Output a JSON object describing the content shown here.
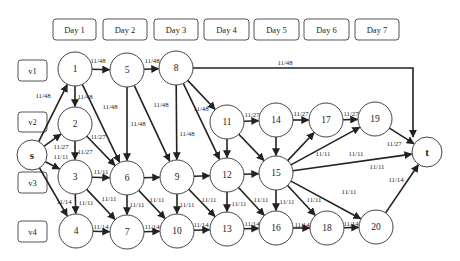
{
  "diagram": {
    "days": [
      "Day 1",
      "Day 2",
      "Day 3",
      "Day 4",
      "Day 5",
      "Day 6",
      "Day 7"
    ],
    "vehicles": [
      "v1",
      "v2",
      "v3",
      "v4"
    ],
    "nodes": [
      {
        "id": "s",
        "label": "s"
      },
      {
        "id": "1",
        "label": "1"
      },
      {
        "id": "2",
        "label": "2"
      },
      {
        "id": "3",
        "label": "3"
      },
      {
        "id": "4",
        "label": "4"
      },
      {
        "id": "5",
        "label": "5"
      },
      {
        "id": "6",
        "label": "6"
      },
      {
        "id": "7",
        "label": "7"
      },
      {
        "id": "8",
        "label": "8"
      },
      {
        "id": "9",
        "label": "9"
      },
      {
        "id": "10",
        "label": "10"
      },
      {
        "id": "11",
        "label": "11"
      },
      {
        "id": "12",
        "label": "12"
      },
      {
        "id": "13",
        "label": "13"
      },
      {
        "id": "14",
        "label": "14"
      },
      {
        "id": "15",
        "label": "15"
      },
      {
        "id": "16",
        "label": "16"
      },
      {
        "id": "17",
        "label": "17"
      },
      {
        "id": "18",
        "label": "18"
      },
      {
        "id": "19",
        "label": "19"
      },
      {
        "id": "20",
        "label": "20"
      },
      {
        "id": "t",
        "label": "t"
      }
    ],
    "edges": [
      {
        "from": "s",
        "to": "1",
        "label": "11/48"
      },
      {
        "from": "s",
        "to": "2",
        "label": "11/27"
      },
      {
        "from": "s",
        "to": "3",
        "label": "11/11"
      },
      {
        "from": "s",
        "to": "4",
        "label": "11/14"
      },
      {
        "from": "1",
        "to": "2",
        "label": "11/48"
      },
      {
        "from": "1",
        "to": "5",
        "label": "11/48"
      },
      {
        "from": "1",
        "to": "6",
        "label": "11/48"
      },
      {
        "from": "2",
        "to": "3",
        "label": "11/27"
      },
      {
        "from": "2",
        "to": "6",
        "label": "11/27"
      },
      {
        "from": "3",
        "to": "4",
        "label": "11/11"
      },
      {
        "from": "3",
        "to": "6",
        "label": "11/11"
      },
      {
        "from": "3",
        "to": "7",
        "label": "11/11"
      },
      {
        "from": "4",
        "to": "7",
        "label": "11/14"
      },
      {
        "from": "5",
        "to": "8",
        "label": "11/48"
      },
      {
        "from": "5",
        "to": "6",
        "label": "11/48"
      },
      {
        "from": "5",
        "to": "9",
        "label": "11/48"
      },
      {
        "from": "6",
        "to": "9",
        "label": ""
      },
      {
        "from": "6",
        "to": "7",
        "label": "11/11"
      },
      {
        "from": "6",
        "to": "10",
        "label": "11/11"
      },
      {
        "from": "7",
        "to": "10",
        "label": "11/14"
      },
      {
        "from": "8",
        "to": "t",
        "label": "11/48"
      },
      {
        "from": "8",
        "to": "9",
        "label": "11/48"
      },
      {
        "from": "8",
        "to": "11",
        "label": "11/48"
      },
      {
        "from": "8",
        "to": "12",
        "label": ""
      },
      {
        "from": "9",
        "to": "10",
        "label": "11/11"
      },
      {
        "from": "9",
        "to": "12",
        "label": ""
      },
      {
        "from": "9",
        "to": "13",
        "label": "11/11"
      },
      {
        "from": "10",
        "to": "13",
        "label": "11/14"
      },
      {
        "from": "11",
        "to": "14",
        "label": "11/27"
      },
      {
        "from": "11",
        "to": "12",
        "label": ""
      },
      {
        "from": "11",
        "to": "15",
        "label": ""
      },
      {
        "from": "12",
        "to": "15",
        "label": ""
      },
      {
        "from": "12",
        "to": "13",
        "label": "11/11"
      },
      {
        "from": "12",
        "to": "16",
        "label": "11/11"
      },
      {
        "from": "13",
        "to": "16",
        "label": "11/14"
      },
      {
        "from": "14",
        "to": "17",
        "label": "11/27"
      },
      {
        "from": "14",
        "to": "15",
        "label": ""
      },
      {
        "from": "15",
        "to": "16",
        "label": "11/11"
      },
      {
        "from": "15",
        "to": "18",
        "label": "11/11"
      },
      {
        "from": "15",
        "to": "17",
        "label": "11/11"
      },
      {
        "from": "15",
        "to": "19",
        "label": "11/11"
      },
      {
        "from": "15",
        "to": "t",
        "label": "11/11"
      },
      {
        "from": "15",
        "to": "20",
        "label": "11/11"
      },
      {
        "from": "16",
        "to": "18",
        "label": "11/14"
      },
      {
        "from": "17",
        "to": "19",
        "label": "11/27"
      },
      {
        "from": "18",
        "to": "20",
        "label": "11/14"
      },
      {
        "from": "19",
        "to": "t",
        "label": "11/27"
      },
      {
        "from": "20",
        "to": "t",
        "label": "11/14"
      }
    ]
  }
}
